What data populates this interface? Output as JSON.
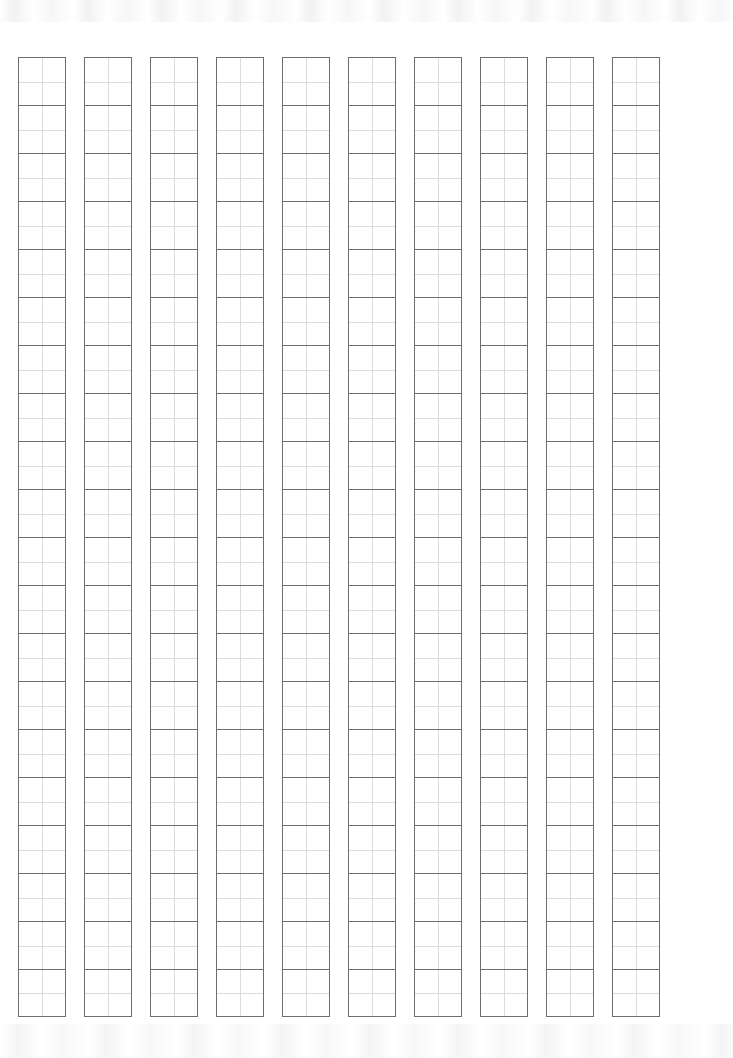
{
  "sheet": {
    "kind": "genkou-youshi-manuscript-paper",
    "title": "",
    "page_width": 733,
    "page_height": 1058,
    "background_color": "#ffffff"
  },
  "grid": {
    "column_count": 10,
    "row_count": 20,
    "total_cells": 200,
    "cell_width": 48,
    "cell_height": 48,
    "column_gap": 18,
    "row_gap": 0,
    "origin_x": 18,
    "origin_y": 57,
    "cell_border_color": "#6e6e6e",
    "cell_guide_color": "#dcdcdc",
    "writing_direction": "vertical-right-to-left",
    "cell_text": [
      [
        "",
        "",
        "",
        "",
        "",
        "",
        "",
        "",
        "",
        "",
        "",
        "",
        "",
        "",
        "",
        "",
        "",
        "",
        "",
        ""
      ],
      [
        "",
        "",
        "",
        "",
        "",
        "",
        "",
        "",
        "",
        "",
        "",
        "",
        "",
        "",
        "",
        "",
        "",
        "",
        "",
        ""
      ],
      [
        "",
        "",
        "",
        "",
        "",
        "",
        "",
        "",
        "",
        "",
        "",
        "",
        "",
        "",
        "",
        "",
        "",
        "",
        "",
        ""
      ],
      [
        "",
        "",
        "",
        "",
        "",
        "",
        "",
        "",
        "",
        "",
        "",
        "",
        "",
        "",
        "",
        "",
        "",
        "",
        "",
        ""
      ],
      [
        "",
        "",
        "",
        "",
        "",
        "",
        "",
        "",
        "",
        "",
        "",
        "",
        "",
        "",
        "",
        "",
        "",
        "",
        "",
        ""
      ],
      [
        "",
        "",
        "",
        "",
        "",
        "",
        "",
        "",
        "",
        "",
        "",
        "",
        "",
        "",
        "",
        "",
        "",
        "",
        "",
        ""
      ],
      [
        "",
        "",
        "",
        "",
        "",
        "",
        "",
        "",
        "",
        "",
        "",
        "",
        "",
        "",
        "",
        "",
        "",
        "",
        "",
        ""
      ],
      [
        "",
        "",
        "",
        "",
        "",
        "",
        "",
        "",
        "",
        "",
        "",
        "",
        "",
        "",
        "",
        "",
        "",
        "",
        "",
        ""
      ],
      [
        "",
        "",
        "",
        "",
        "",
        "",
        "",
        "",
        "",
        "",
        "",
        "",
        "",
        "",
        "",
        "",
        "",
        "",
        "",
        ""
      ],
      [
        "",
        "",
        "",
        "",
        "",
        "",
        "",
        "",
        "",
        "",
        "",
        "",
        "",
        "",
        "",
        "",
        "",
        "",
        "",
        ""
      ]
    ]
  },
  "artifacts": {
    "top_band_label": "",
    "bottom_band_label": ""
  }
}
